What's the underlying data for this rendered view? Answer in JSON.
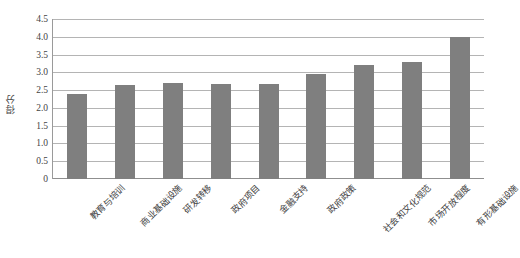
{
  "chart_data": {
    "type": "bar",
    "title": "",
    "subtitle": "",
    "xlabel": "",
    "ylabel": "得分",
    "categories": [
      "教育与培训",
      "商业基础设施",
      "研发转移",
      "政府项目",
      "金融支持",
      "政府政策",
      "社会和文化规范",
      "市场开放程度",
      "有形基础设施"
    ],
    "values": [
      2.4,
      2.65,
      2.7,
      2.68,
      2.68,
      2.95,
      3.2,
      3.28,
      4.0
    ],
    "ylim": [
      0,
      4.5
    ],
    "ytick_labels": [
      "4.5",
      "4.0",
      "3.5",
      "3.0",
      "2.5",
      "2.0",
      "1.5",
      "1.0",
      "0.5",
      "0"
    ],
    "ytick_values": [
      4.5,
      4.0,
      3.5,
      3.0,
      2.5,
      2.0,
      1.5,
      1.0,
      0.5,
      0
    ],
    "grid": true,
    "legend": false,
    "legend_position": "none",
    "series": [
      {
        "name": "得分",
        "color": "#7f7f7f",
        "values": [
          2.4,
          2.65,
          2.7,
          2.68,
          2.68,
          2.95,
          3.2,
          3.28,
          4.0
        ]
      }
    ],
    "colors": {
      "bar": "#7f7f7f",
      "gridline": "#b4b4b4",
      "axis": "#8f8f8f",
      "text": "#3f3f3f",
      "background": "#ffffff"
    }
  }
}
